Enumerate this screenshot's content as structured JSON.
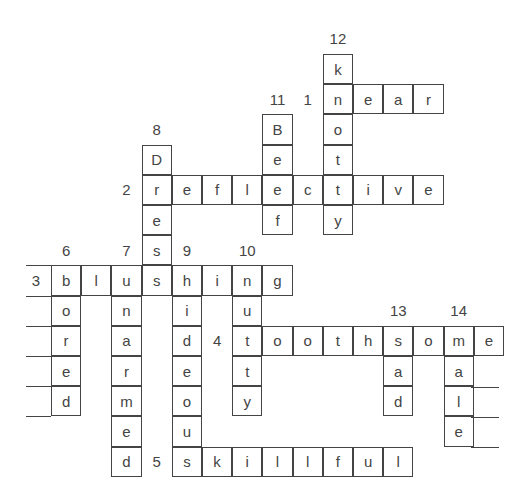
{
  "puzzle": {
    "type": "crossword",
    "across": [
      {
        "number": "1",
        "answer": "near",
        "row": 1,
        "col": 10,
        "dir": "across"
      },
      {
        "number": "2",
        "answer": "reflective",
        "row": 4,
        "col": 4,
        "dir": "across"
      },
      {
        "number": "3",
        "answer": "blushing",
        "row": 7,
        "col": 1,
        "dir": "across"
      },
      {
        "number": "4",
        "answer": "toothsome",
        "row": 9,
        "col": 7,
        "dir": "across"
      },
      {
        "number": "5",
        "answer": "skillful",
        "row": 13,
        "col": 5,
        "dir": "across"
      }
    ],
    "down": [
      {
        "number": "6",
        "answer": "bored",
        "row": 7,
        "col": 1,
        "dir": "down"
      },
      {
        "number": "7",
        "answer": "unarmed",
        "row": 7,
        "col": 3,
        "dir": "down"
      },
      {
        "number": "8",
        "answer": "Dress",
        "row": 3,
        "col": 4,
        "dir": "down"
      },
      {
        "number": "9",
        "answer": "hideous",
        "row": 7,
        "col": 5,
        "dir": "down"
      },
      {
        "number": "10",
        "answer": "nutty",
        "row": 7,
        "col": 7,
        "dir": "down"
      },
      {
        "number": "11",
        "answer": "Beef",
        "row": 2,
        "col": 8,
        "dir": "down"
      },
      {
        "number": "12",
        "answer": "knotty",
        "row": 0,
        "col": 10,
        "dir": "down"
      },
      {
        "number": "13",
        "answer": "sad",
        "row": 9,
        "col": 12,
        "dir": "down"
      },
      {
        "number": "14",
        "answer": "male",
        "row": 9,
        "col": 14,
        "dir": "down"
      }
    ],
    "labels": [
      {
        "text": "12",
        "row": -1,
        "col": 10
      },
      {
        "text": "11",
        "row": 1,
        "col": 8
      },
      {
        "text": "1",
        "row": 1,
        "col": 9
      },
      {
        "text": "8",
        "row": 2,
        "col": 4
      },
      {
        "text": "2",
        "row": 4,
        "col": 3
      },
      {
        "text": "6",
        "row": 6,
        "col": 1
      },
      {
        "text": "7",
        "row": 6,
        "col": 3
      },
      {
        "text": "9",
        "row": 6,
        "col": 5
      },
      {
        "text": "10",
        "row": 6,
        "col": 7
      },
      {
        "text": "3",
        "row": 7,
        "col": 0
      },
      {
        "text": "13",
        "row": 8,
        "col": 12
      },
      {
        "text": "14",
        "row": 8,
        "col": 14
      },
      {
        "text": "4",
        "row": 9,
        "col": 6
      },
      {
        "text": "5",
        "row": 13,
        "col": 4
      }
    ],
    "open_lines": [
      {
        "x1": 26,
        "x2": 51,
        "y": 265
      },
      {
        "x1": 26,
        "x2": 51,
        "y": 296
      },
      {
        "x1": 26,
        "x2": 51,
        "y": 326
      },
      {
        "x1": 26,
        "x2": 51,
        "y": 356
      },
      {
        "x1": 26,
        "x2": 51,
        "y": 386
      },
      {
        "x1": 26,
        "x2": 51,
        "y": 416
      },
      {
        "x1": 471,
        "x2": 499,
        "y": 387
      },
      {
        "x1": 471,
        "x2": 499,
        "y": 417
      },
      {
        "x1": 471,
        "x2": 499,
        "y": 447
      }
    ]
  },
  "layout": {
    "origin_x": 20.8,
    "origin_y": 54,
    "cell": 30.2
  }
}
